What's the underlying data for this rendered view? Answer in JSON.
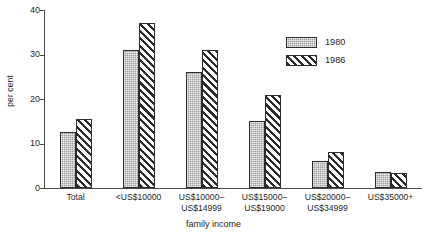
{
  "chart_data": {
    "type": "bar",
    "title": "",
    "xlabel": "family income",
    "ylabel": "per cent",
    "ylim": [
      0,
      40
    ],
    "yticks": [
      0,
      10,
      20,
      30,
      40
    ],
    "ytick_labels": [
      "0",
      "10",
      "20",
      "30",
      "40"
    ],
    "grid": false,
    "legend_position": "top-right",
    "categories": [
      "Total",
      "<US$10000",
      "US$10000–\nUS$14999",
      "US$15000–\nUS$19000",
      "US$20000–\nUS$34999",
      "US$35000+"
    ],
    "series": [
      {
        "name": "1980",
        "pattern": "stipple-gray",
        "color": "#9a9a9a",
        "values": [
          12.7,
          31.0,
          26.0,
          15.0,
          6.0,
          3.6
        ]
      },
      {
        "name": "1986",
        "pattern": "diagonal-hatch",
        "color": "#2b2b2b",
        "values": [
          15.5,
          37.0,
          31.0,
          21.0,
          8.0,
          3.3
        ]
      }
    ]
  },
  "axes": {
    "y_title": "per cent",
    "x_title": "family income"
  },
  "legend": {
    "entries": [
      {
        "label": "1980"
      },
      {
        "label": "1986"
      }
    ]
  }
}
